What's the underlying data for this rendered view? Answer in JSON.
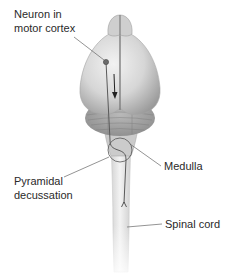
{
  "figure": {
    "labels": {
      "neuron": [
        "Neuron in",
        "motor cortex"
      ],
      "medulla": "Medulla",
      "pyramidal": [
        "Pyramidal",
        "decussation"
      ],
      "spinal_cord": "Spinal cord"
    },
    "colors": {
      "tissue_light": "#e6e6e6",
      "tissue_mid": "#bdbdbd",
      "tissue_dark": "#8e8e8e",
      "line": "#555555",
      "neuron": "#6b6b6b",
      "text": "#2a2a2a"
    }
  }
}
